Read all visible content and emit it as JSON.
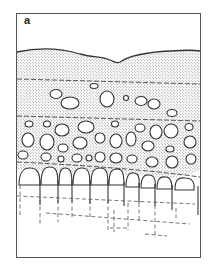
{
  "figure": {
    "panel_label": "a",
    "colors": {
      "frame": "#555555",
      "outline": "#333333",
      "stipple": "#8a8a8a",
      "background": "#ffffff"
    },
    "layers": [
      "wavy-top-surface",
      "upper-stippled-layer",
      "scattered-vesicle-layer",
      "dense-vesicle-layer",
      "columnar-layer",
      "dashed-projection-lines"
    ]
  }
}
